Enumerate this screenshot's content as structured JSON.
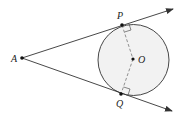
{
  "diagram": {
    "type": "geometry",
    "points": {
      "A": {
        "label": "A",
        "x": 22,
        "y": 58
      },
      "P": {
        "label": "P",
        "x": 122,
        "y": 25
      },
      "Q": {
        "label": "Q",
        "x": 121,
        "y": 94
      },
      "O": {
        "label": "O",
        "x": 133,
        "y": 59
      }
    },
    "circle": {
      "cx": 133.5,
      "cy": 60,
      "r": 35.5,
      "fill": "#f2f2f2",
      "stroke": "#333333"
    },
    "tangent_rays": [
      {
        "from": "A",
        "through": "P",
        "end": {
          "x": 173,
          "y": 9
        }
      },
      {
        "from": "A",
        "through": "Q",
        "end": {
          "x": 172,
          "y": 111
        }
      }
    ],
    "dashed_segments": [
      [
        "P",
        "O"
      ],
      [
        "O",
        "Q"
      ]
    ],
    "right_angle_marks": [
      "P",
      "Q"
    ],
    "colors": {
      "line": "#333333",
      "dash": "#777777",
      "point": "#111111"
    }
  }
}
